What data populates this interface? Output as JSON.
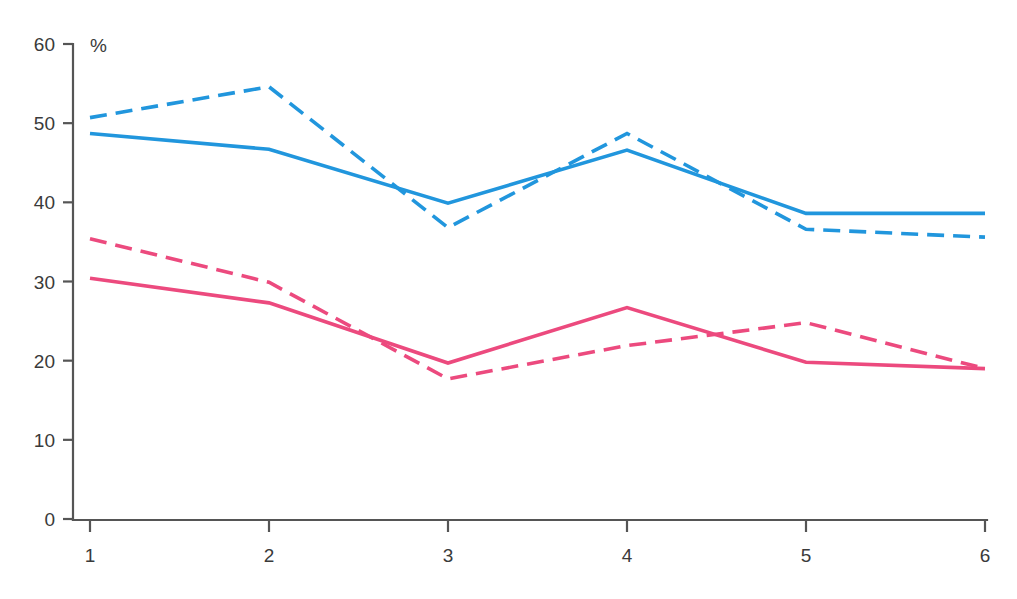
{
  "chart_data": {
    "type": "line",
    "title": "",
    "subtitle": "",
    "xlabel": "",
    "ylabel": "",
    "unit_label": "%",
    "x": [
      1,
      2,
      3,
      4,
      5,
      6
    ],
    "categories": [
      "1",
      "2",
      "3",
      "4",
      "5",
      "6"
    ],
    "xticklabels": [
      "1",
      "2",
      "3",
      "4",
      "5",
      "6"
    ],
    "yticklabels": [
      "0",
      "10",
      "20",
      "30",
      "40",
      "50",
      "60"
    ],
    "yticks": [
      0,
      10,
      20,
      30,
      40,
      50,
      60
    ],
    "ylim": [
      0,
      60
    ],
    "xlim": [
      1,
      6
    ],
    "grid": false,
    "legend": "none",
    "series": [
      {
        "name": "blue-dashed",
        "style": "dashed",
        "color": "#2196dd",
        "values": [
          50.7,
          54.6,
          36.8,
          48.7,
          36.6,
          35.6
        ]
      },
      {
        "name": "blue-solid",
        "style": "solid",
        "color": "#2196dd",
        "values": [
          48.7,
          46.7,
          39.9,
          46.6,
          38.6,
          38.6
        ]
      },
      {
        "name": "pink-dashed",
        "style": "dashed",
        "color": "#ec4a7e",
        "values": [
          35.4,
          29.9,
          17.7,
          21.9,
          24.8,
          19.0
        ]
      },
      {
        "name": "pink-solid",
        "style": "solid",
        "color": "#ec4a7e",
        "values": [
          30.4,
          27.3,
          19.7,
          26.7,
          19.8,
          19.0
        ]
      }
    ]
  },
  "colors": {
    "blue": "#2196dd",
    "pink": "#ec4a7e",
    "axis": "#555555",
    "text": "#3a3a3a",
    "background": "#ffffff"
  }
}
